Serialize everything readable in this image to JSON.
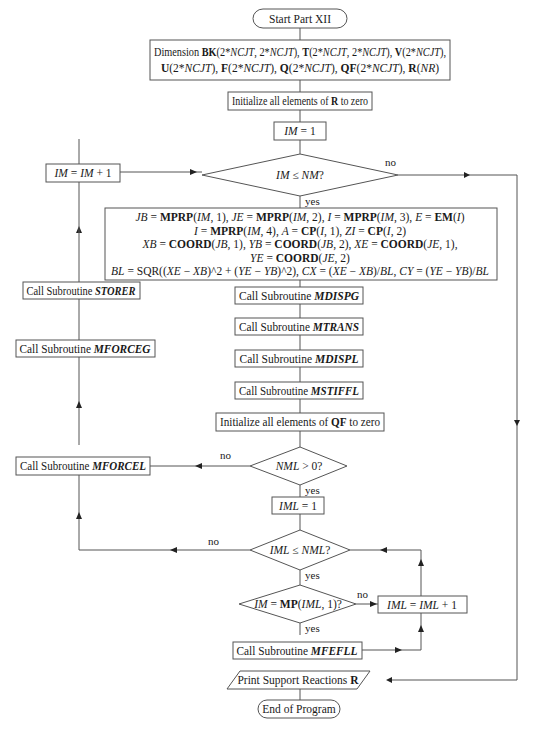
{
  "nodes": {
    "start": "Start Part XII",
    "dimension_line1_prefix": "Dimension ",
    "dimension_line1": [
      {
        "t": "BK",
        "s": "b"
      },
      {
        "t": "(2*",
        "s": ""
      },
      {
        "t": "NCJT",
        "s": "i"
      },
      {
        "t": ", 2*",
        "s": ""
      },
      {
        "t": "NCJT",
        "s": "i"
      },
      {
        "t": "), ",
        "s": ""
      },
      {
        "t": "T",
        "s": "b"
      },
      {
        "t": "(2*",
        "s": ""
      },
      {
        "t": "NCJT",
        "s": "i"
      },
      {
        "t": ", 2*",
        "s": ""
      },
      {
        "t": "NCJT",
        "s": "i"
      },
      {
        "t": "), ",
        "s": ""
      },
      {
        "t": "V",
        "s": "b"
      },
      {
        "t": "(2*",
        "s": ""
      },
      {
        "t": "NCJT",
        "s": "i"
      },
      {
        "t": "),",
        "s": ""
      }
    ],
    "dimension_line2": [
      {
        "t": "U",
        "s": "b"
      },
      {
        "t": "(2*",
        "s": ""
      },
      {
        "t": "NCJT",
        "s": "i"
      },
      {
        "t": "), ",
        "s": ""
      },
      {
        "t": "F",
        "s": "b"
      },
      {
        "t": "(2*",
        "s": ""
      },
      {
        "t": "NCJT",
        "s": "i"
      },
      {
        "t": "), ",
        "s": ""
      },
      {
        "t": "Q",
        "s": "b"
      },
      {
        "t": "(2*",
        "s": ""
      },
      {
        "t": "NCJT",
        "s": "i"
      },
      {
        "t": "), ",
        "s": ""
      },
      {
        "t": "QF",
        "s": "b"
      },
      {
        "t": "(2*",
        "s": ""
      },
      {
        "t": "NCJT",
        "s": "i"
      },
      {
        "t": "), ",
        "s": ""
      },
      {
        "t": "R",
        "s": "b"
      },
      {
        "t": "(",
        "s": ""
      },
      {
        "t": "NR",
        "s": "i"
      },
      {
        "t": ")",
        "s": ""
      }
    ],
    "init_r": [
      {
        "t": "Initialize all elements of ",
        "s": ""
      },
      {
        "t": "R",
        "s": "b"
      },
      {
        "t": " to zero",
        "s": ""
      }
    ],
    "im_eq_1": [
      {
        "t": "IM",
        "s": "i"
      },
      {
        "t": " = 1",
        "s": ""
      }
    ],
    "im_le_nm": [
      {
        "t": "IM",
        "s": "i"
      },
      {
        "t": " ≤ ",
        "s": ""
      },
      {
        "t": "NM",
        "s": "i"
      },
      {
        "t": "?",
        "s": ""
      }
    ],
    "im_inc": [
      {
        "t": "IM",
        "s": "i"
      },
      {
        "t": " = ",
        "s": ""
      },
      {
        "t": "IM",
        "s": "i"
      },
      {
        "t": " + 1",
        "s": ""
      }
    ],
    "calc_line1": [
      {
        "t": "JB",
        "s": "i"
      },
      {
        "t": " = ",
        "s": ""
      },
      {
        "t": "MPRP",
        "s": "b"
      },
      {
        "t": "(",
        "s": ""
      },
      {
        "t": "IM",
        "s": "i"
      },
      {
        "t": ", 1), ",
        "s": ""
      },
      {
        "t": "JE",
        "s": "i"
      },
      {
        "t": " = ",
        "s": ""
      },
      {
        "t": "MPRP",
        "s": "b"
      },
      {
        "t": "(",
        "s": ""
      },
      {
        "t": "IM",
        "s": "i"
      },
      {
        "t": ", 2), ",
        "s": ""
      },
      {
        "t": "I",
        "s": "i"
      },
      {
        "t": " = ",
        "s": ""
      },
      {
        "t": "MPRP",
        "s": "b"
      },
      {
        "t": "(",
        "s": ""
      },
      {
        "t": "IM",
        "s": "i"
      },
      {
        "t": ", 3), ",
        "s": ""
      },
      {
        "t": "E",
        "s": "i"
      },
      {
        "t": " = ",
        "s": ""
      },
      {
        "t": "EM",
        "s": "b"
      },
      {
        "t": "(",
        "s": ""
      },
      {
        "t": "I",
        "s": "i"
      },
      {
        "t": ")",
        "s": ""
      }
    ],
    "calc_line2": [
      {
        "t": "I",
        "s": "i"
      },
      {
        "t": " = ",
        "s": ""
      },
      {
        "t": "MPRP",
        "s": "b"
      },
      {
        "t": "(",
        "s": ""
      },
      {
        "t": "IM",
        "s": "i"
      },
      {
        "t": ", 4), ",
        "s": ""
      },
      {
        "t": "A",
        "s": "i"
      },
      {
        "t": " = ",
        "s": ""
      },
      {
        "t": "CP",
        "s": "b"
      },
      {
        "t": "(",
        "s": ""
      },
      {
        "t": "I",
        "s": "i"
      },
      {
        "t": ", 1), ",
        "s": ""
      },
      {
        "t": "ZI",
        "s": "i"
      },
      {
        "t": " = ",
        "s": ""
      },
      {
        "t": "CP",
        "s": "b"
      },
      {
        "t": "(",
        "s": ""
      },
      {
        "t": "I",
        "s": "i"
      },
      {
        "t": ", 2)",
        "s": ""
      }
    ],
    "calc_line3": [
      {
        "t": "XB",
        "s": "i"
      },
      {
        "t": " = ",
        "s": ""
      },
      {
        "t": "COORD",
        "s": "b"
      },
      {
        "t": "(",
        "s": ""
      },
      {
        "t": "JB",
        "s": "i"
      },
      {
        "t": ", 1), ",
        "s": ""
      },
      {
        "t": "YB",
        "s": "i"
      },
      {
        "t": " = ",
        "s": ""
      },
      {
        "t": "COORD",
        "s": "b"
      },
      {
        "t": "(",
        "s": ""
      },
      {
        "t": "JB",
        "s": "i"
      },
      {
        "t": ", 2), ",
        "s": ""
      },
      {
        "t": "XE",
        "s": "i"
      },
      {
        "t": " = ",
        "s": ""
      },
      {
        "t": "COORD",
        "s": "b"
      },
      {
        "t": "(",
        "s": ""
      },
      {
        "t": "JE",
        "s": "i"
      },
      {
        "t": ", 1),",
        "s": ""
      }
    ],
    "calc_line4": [
      {
        "t": "YE",
        "s": "i"
      },
      {
        "t": " = ",
        "s": ""
      },
      {
        "t": "COORD",
        "s": "b"
      },
      {
        "t": "(",
        "s": ""
      },
      {
        "t": "JE",
        "s": "i"
      },
      {
        "t": ", 2)",
        "s": ""
      }
    ],
    "calc_line5": [
      {
        "t": "BL",
        "s": "i"
      },
      {
        "t": " = SQR((",
        "s": ""
      },
      {
        "t": "XE",
        "s": "i"
      },
      {
        "t": " − ",
        "s": ""
      },
      {
        "t": "XB",
        "s": "i"
      },
      {
        "t": ")^2 + (",
        "s": ""
      },
      {
        "t": "YE",
        "s": "i"
      },
      {
        "t": " − ",
        "s": ""
      },
      {
        "t": "YB",
        "s": "i"
      },
      {
        "t": ")^2), ",
        "s": ""
      },
      {
        "t": "CX",
        "s": "i"
      },
      {
        "t": " = (",
        "s": ""
      },
      {
        "t": "XE",
        "s": "i"
      },
      {
        "t": " − ",
        "s": ""
      },
      {
        "t": "XB",
        "s": "i"
      },
      {
        "t": ")/",
        "s": ""
      },
      {
        "t": "BL",
        "s": "i"
      },
      {
        "t": ", ",
        "s": ""
      },
      {
        "t": "CY",
        "s": "i"
      },
      {
        "t": " = (",
        "s": ""
      },
      {
        "t": "YE",
        "s": "i"
      },
      {
        "t": " − ",
        "s": ""
      },
      {
        "t": "YB",
        "s": "i"
      },
      {
        "t": ")/",
        "s": ""
      },
      {
        "t": "BL",
        "s": "i"
      }
    ],
    "mdispg": [
      {
        "t": "Call Subroutine ",
        "s": ""
      },
      {
        "t": "MDISPG",
        "s": "bi"
      }
    ],
    "mtrans": [
      {
        "t": "Call Subroutine ",
        "s": ""
      },
      {
        "t": "MTRANS",
        "s": "bi"
      }
    ],
    "mdispl": [
      {
        "t": "Call Subroutine ",
        "s": ""
      },
      {
        "t": "MDISPL",
        "s": "bi"
      }
    ],
    "mstiffl": [
      {
        "t": "Call Subroutine ",
        "s": ""
      },
      {
        "t": "MSTIFFL",
        "s": "bi"
      }
    ],
    "init_qf": [
      {
        "t": "Initialize all elements of ",
        "s": ""
      },
      {
        "t": "QF",
        "s": "b"
      },
      {
        "t": " to zero",
        "s": ""
      }
    ],
    "nml_gt_0": [
      {
        "t": "NML",
        "s": "i"
      },
      {
        "t": " > 0?",
        "s": ""
      }
    ],
    "iml_eq_1": [
      {
        "t": "IML",
        "s": "i"
      },
      {
        "t": " = 1",
        "s": ""
      }
    ],
    "iml_le_nml": [
      {
        "t": "IML",
        "s": "i"
      },
      {
        "t": " ≤ ",
        "s": ""
      },
      {
        "t": "NML",
        "s": "i"
      },
      {
        "t": "?",
        "s": ""
      }
    ],
    "im_eq_mp": [
      {
        "t": "IM",
        "s": "i"
      },
      {
        "t": " = ",
        "s": ""
      },
      {
        "t": "MP",
        "s": "b"
      },
      {
        "t": "(",
        "s": ""
      },
      {
        "t": "IML",
        "s": "i"
      },
      {
        "t": ", 1)?",
        "s": ""
      }
    ],
    "iml_inc": [
      {
        "t": "IML",
        "s": "i"
      },
      {
        "t": " = ",
        "s": ""
      },
      {
        "t": "IML",
        "s": "i"
      },
      {
        "t": " + 1",
        "s": ""
      }
    ],
    "mfefll": [
      {
        "t": "Call Subroutine ",
        "s": ""
      },
      {
        "t": "MFEFLL",
        "s": "bi"
      }
    ],
    "mforcel": [
      {
        "t": "Call Subroutine ",
        "s": ""
      },
      {
        "t": "MFORCEL",
        "s": "bi"
      }
    ],
    "mforceg": [
      {
        "t": "Call Subroutine ",
        "s": ""
      },
      {
        "t": "MFORCEG",
        "s": "bi"
      }
    ],
    "storer": [
      {
        "t": "Call Subroutine ",
        "s": ""
      },
      {
        "t": "STORER",
        "s": "bi"
      }
    ],
    "print_r": [
      {
        "t": "Print Support Reactions ",
        "s": ""
      },
      {
        "t": "R",
        "s": "b"
      }
    ],
    "end": "End of Program"
  },
  "labels": {
    "yes": "yes",
    "no": "no"
  },
  "colors": {
    "stroke": "#555555",
    "text": "#1a1a1a",
    "background": "#ffffff"
  }
}
